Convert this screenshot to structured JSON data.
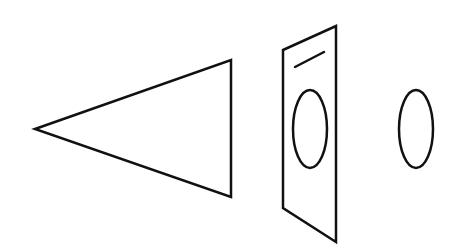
{
  "diagram": {
    "stroke_color": "#111111",
    "background": "#ffffff",
    "shapes": [
      {
        "id": "cone",
        "type": "triangle",
        "points": [
          [
            35,
            129
          ],
          [
            231,
            60
          ],
          [
            231,
            197
          ]
        ]
      },
      {
        "id": "plate",
        "type": "parallelogram",
        "points": [
          [
            283,
            50
          ],
          [
            336,
            26
          ],
          [
            336,
            242
          ],
          [
            283,
            208
          ]
        ]
      },
      {
        "id": "slit",
        "type": "line",
        "from": [
          295,
          67
        ],
        "to": [
          324,
          52
        ]
      },
      {
        "id": "plate-hole",
        "type": "ellipse",
        "cx": 310,
        "cy": 129,
        "rx": 17,
        "ry": 39
      },
      {
        "id": "disc",
        "type": "ellipse",
        "cx": 416,
        "cy": 129,
        "rx": 17,
        "ry": 39
      }
    ]
  }
}
